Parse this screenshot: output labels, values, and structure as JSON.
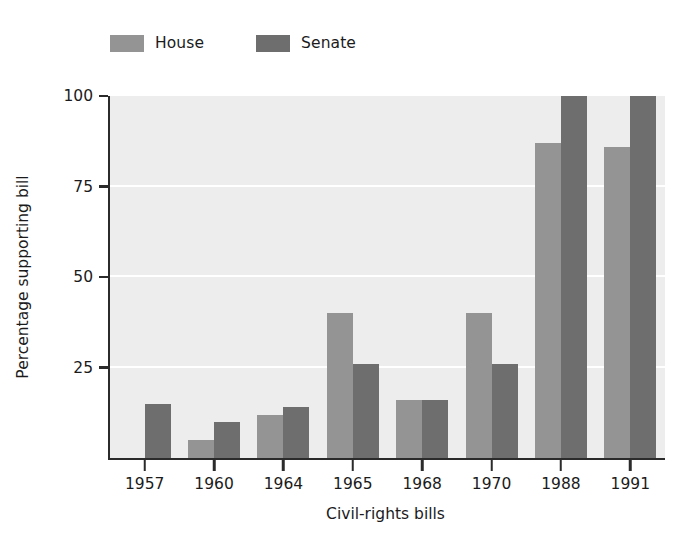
{
  "chart_data": {
    "type": "bar",
    "title": "",
    "xlabel": "Civil-rights bills",
    "ylabel": "Percentage supporting bill",
    "categories": [
      "1957",
      "1960",
      "1964",
      "1965",
      "1968",
      "1970",
      "1988",
      "1991"
    ],
    "series": [
      {
        "name": "House",
        "color": "#949494",
        "values": [
          null,
          5,
          12,
          40,
          16,
          40,
          87,
          86
        ]
      },
      {
        "name": "Senate",
        "color": "#6e6e6e",
        "values": [
          15,
          10,
          14,
          26,
          16,
          26,
          100,
          100
        ]
      }
    ],
    "ylim": [
      0,
      100
    ],
    "yticks": [
      0,
      25,
      50,
      75,
      100
    ],
    "ytick_labels": [
      "",
      "25",
      "50",
      "75",
      "100"
    ],
    "grid": "horizontal-white",
    "legend_position": "top-left",
    "plot_background": "#ededed",
    "axis_color": "#2b2b2b"
  },
  "legend": {
    "items": [
      {
        "label": "House",
        "color": "#949494"
      },
      {
        "label": "Senate",
        "color": "#6e6e6e"
      }
    ]
  },
  "axes": {
    "y_title": "Percentage supporting bill",
    "x_title": "Civil-rights bills",
    "y_labels": [
      "100",
      "75",
      "50",
      "25"
    ],
    "x_labels": [
      "1957",
      "1960",
      "1964",
      "1965",
      "1968",
      "1970",
      "1988",
      "1991"
    ]
  }
}
